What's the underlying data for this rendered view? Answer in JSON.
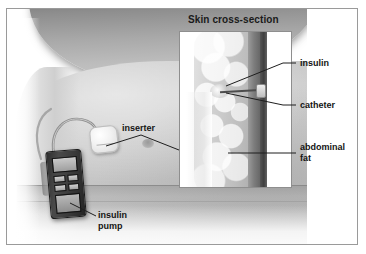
{
  "figure": {
    "kind": "medical-illustration",
    "background": "#ffffff",
    "frame_color": "#9a9a9a"
  },
  "inset_panel": {
    "title": "Skin cross-section",
    "border_color": "#8e8e8e",
    "background": "#ffffff"
  },
  "labels": {
    "insulin": "insulin",
    "catheter": "catheter",
    "abdominal_fat": "abdominal\nfat",
    "inserter": "inserter",
    "insulin_pump": "insulin\npump"
  },
  "colors": {
    "label_text": "#141414",
    "leader_line": "#1e1e1e",
    "skin_light": "#cfcfcf",
    "skin_mid": "#a9a9a9",
    "skin_dark": "#4e4e4e",
    "pump_body": "#3a3a3a",
    "inserter_patch": "#f2f2f2"
  }
}
